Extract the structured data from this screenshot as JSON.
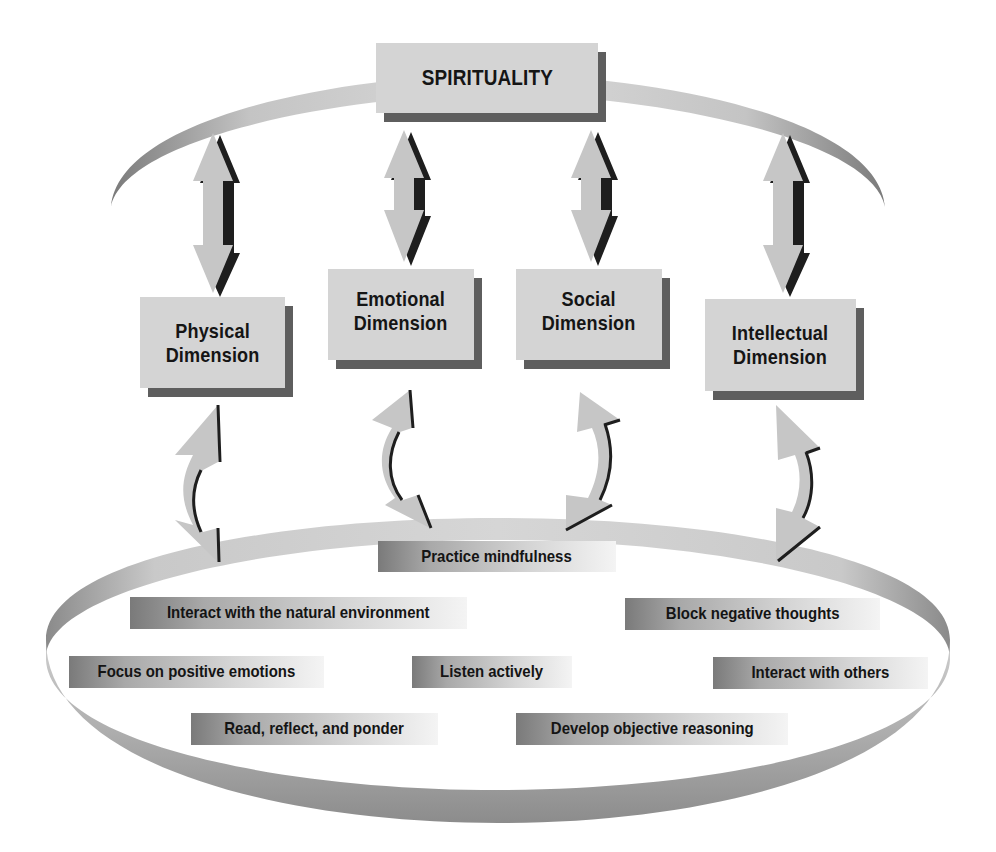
{
  "diagram": {
    "top": {
      "label": "SPIRITUALITY"
    },
    "dimensions": [
      {
        "line1": "Physical",
        "line2": "Dimension"
      },
      {
        "line1": "Emotional",
        "line2": "Dimension"
      },
      {
        "line1": "Social",
        "line2": "Dimension"
      },
      {
        "line1": "Intellectual",
        "line2": "Dimension"
      }
    ],
    "practices": [
      "Practice mindfulness",
      "Interact with the natural environment",
      "Block negative thoughts",
      "Focus on positive emotions",
      "Listen actively",
      "Interact with others",
      "Read, reflect, and ponder",
      "Develop objective reasoning"
    ],
    "colors": {
      "box_fill": "#d4d4d4",
      "box_shadow": "#5e5e5e",
      "arrow_fill": "#c8c8c8",
      "arrow_edge": "#1e1e1e",
      "ring_light": "#d2d2d2",
      "ring_dark": "#7c7c7c"
    }
  }
}
